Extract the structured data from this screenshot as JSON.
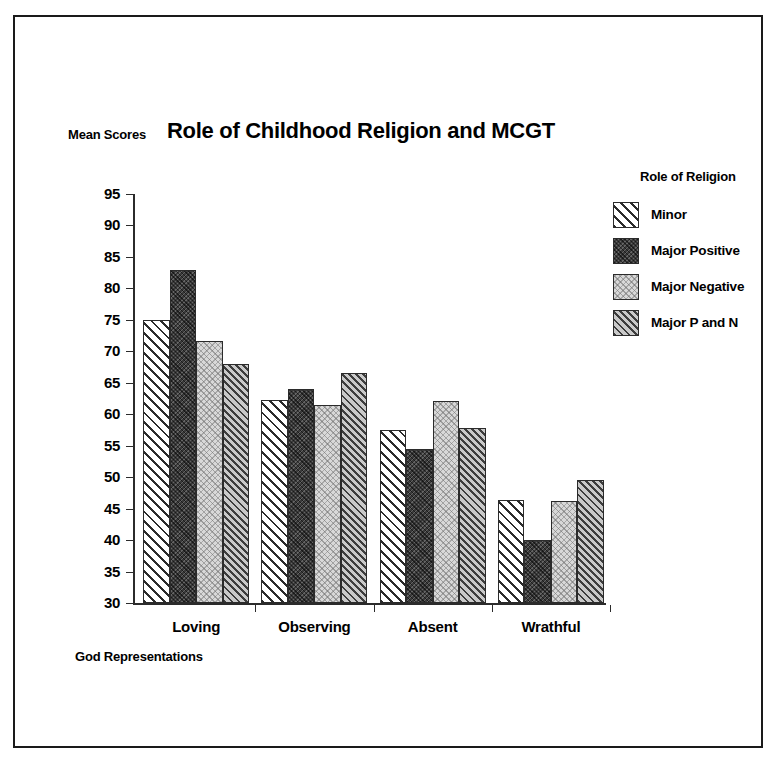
{
  "chart_data": {
    "type": "bar",
    "title": "Role of Childhood Religion and MCGT",
    "xlabel": "God Representations",
    "ylabel": "Mean Scores",
    "categories": [
      "Loving",
      "Observing",
      "Absent",
      "Wrathful"
    ],
    "series": [
      {
        "name": "Minor",
        "values": [
          75.0,
          62.2,
          57.5,
          46.3
        ]
      },
      {
        "name": "Major Positive",
        "values": [
          83.0,
          64.0,
          54.5,
          40.0
        ]
      },
      {
        "name": "Major Negative",
        "values": [
          71.6,
          61.4,
          62.1,
          46.2
        ]
      },
      {
        "name": "Major P and N",
        "values": [
          68.0,
          66.6,
          57.8,
          49.6
        ]
      }
    ],
    "ylim": [
      30,
      95
    ],
    "ytick_values": [
      95,
      90,
      85,
      80,
      75,
      70,
      65,
      60,
      55,
      50,
      45,
      40,
      35,
      30
    ],
    "ytick_labels": [
      "95",
      "90",
      "85",
      "80",
      "75",
      "70",
      "65",
      "60",
      "55",
      "50",
      "45",
      "40",
      "35",
      "30"
    ],
    "grid": false,
    "legend_position": "right",
    "legend_title": "Role of Religion",
    "series_patterns": [
      "diagonal-hatch-white",
      "dense-dark-fill",
      "light-dotted-fill",
      "gray-diagonal-hatch"
    ],
    "series_colors": [
      "#ffffff",
      "#3a3a3a",
      "#d8d8d8",
      "#8f8f8f"
    ]
  }
}
